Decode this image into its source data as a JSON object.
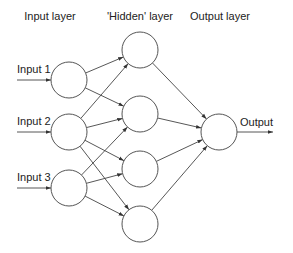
{
  "diagram": {
    "colors": {
      "stroke": "#555555",
      "text": "#222222",
      "background": "#ffffff"
    },
    "layers": [
      {
        "id": "input",
        "label": "Input layer",
        "label_x": 50,
        "label_y": 20
      },
      {
        "id": "hidden",
        "label": "'Hidden' layer",
        "label_x": 140,
        "label_y": 20
      },
      {
        "id": "output",
        "label": "Output layer",
        "label_x": 220,
        "label_y": 20
      }
    ],
    "nodes": [
      {
        "id": "i1",
        "layer": "input",
        "cx": 69,
        "cy": 80,
        "r": 18
      },
      {
        "id": "i2",
        "layer": "input",
        "cx": 69,
        "cy": 132,
        "r": 18
      },
      {
        "id": "i3",
        "layer": "input",
        "cx": 69,
        "cy": 188,
        "r": 18
      },
      {
        "id": "h1",
        "layer": "hidden",
        "cx": 140,
        "cy": 50,
        "r": 18
      },
      {
        "id": "h2",
        "layer": "hidden",
        "cx": 140,
        "cy": 114,
        "r": 18
      },
      {
        "id": "h3",
        "layer": "hidden",
        "cx": 140,
        "cy": 169,
        "r": 18
      },
      {
        "id": "h4",
        "layer": "hidden",
        "cx": 140,
        "cy": 224,
        "r": 18
      },
      {
        "id": "o1",
        "layer": "output",
        "cx": 219,
        "cy": 132,
        "r": 18
      }
    ],
    "inputs": [
      {
        "label": "Input 1",
        "target": "i1",
        "x1": 17,
        "label_y": 73
      },
      {
        "label": "Input 2",
        "target": "i2",
        "x1": 17,
        "label_y": 125
      },
      {
        "label": "Input 3",
        "target": "i3",
        "x1": 17,
        "label_y": 181
      }
    ],
    "output": {
      "label": "Output",
      "source": "o1",
      "x2": 273,
      "label_x": 240,
      "label_y": 126
    },
    "edges": [
      [
        "i1",
        "h1"
      ],
      [
        "i1",
        "h2"
      ],
      [
        "i2",
        "h1"
      ],
      [
        "i2",
        "h2"
      ],
      [
        "i2",
        "h3"
      ],
      [
        "i2",
        "h4"
      ],
      [
        "i3",
        "h2"
      ],
      [
        "i3",
        "h3"
      ],
      [
        "i3",
        "h4"
      ],
      [
        "h1",
        "o1"
      ],
      [
        "h2",
        "o1"
      ],
      [
        "h3",
        "o1"
      ],
      [
        "h4",
        "o1"
      ]
    ]
  }
}
